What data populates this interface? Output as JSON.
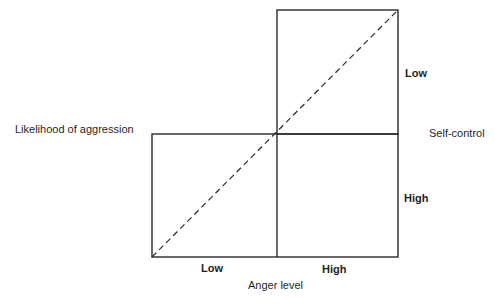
{
  "diagram": {
    "type": "quadrant-diagram",
    "labels": {
      "y_axis": "Likelihood of aggression",
      "x_axis": "Anger level",
      "right_axis": "Self-control",
      "x_low": "Low",
      "x_high": "High",
      "right_low": "Low",
      "right_high": "High"
    },
    "colors": {
      "line": "#2a2a2a",
      "background": "#ffffff",
      "text": "#1f1f1f"
    }
  }
}
